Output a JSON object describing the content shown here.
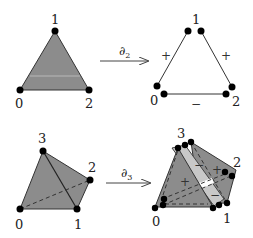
{
  "colors": {
    "face_dark": "#8c8c8c",
    "face_light": "#c8c8c8",
    "face_mid": "#a6a6a6",
    "edge": "#333333",
    "vertex": "#000000",
    "background": "#ffffff"
  },
  "triangle": {
    "vertices": [
      "0",
      "1",
      "2"
    ]
  },
  "boundary2": {
    "operator": "∂",
    "subscript": "2",
    "vertices": [
      "0",
      "1",
      "2"
    ],
    "signs": {
      "left_edge": "+",
      "right_edge": "+",
      "bottom_edge": "−"
    }
  },
  "tetrahedron": {
    "vertices": [
      "0",
      "1",
      "2",
      "3"
    ]
  },
  "boundary3": {
    "operator": "∂",
    "subscript": "3",
    "vertices": [
      "0",
      "1",
      "2",
      "3"
    ],
    "signs": [
      "+",
      "−",
      "+",
      "−"
    ]
  }
}
